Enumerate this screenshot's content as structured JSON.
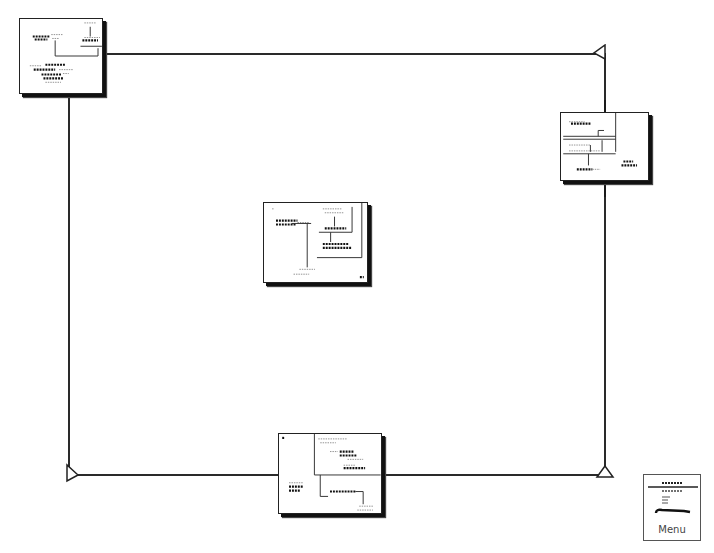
{
  "diagram": {
    "type": "overview-map",
    "frame": {
      "left": 69,
      "top": 54,
      "right": 605,
      "bottom": 475,
      "color": "#2a2a2a"
    },
    "corner_markers": [
      {
        "corner": "top-right",
        "shape": "triangle-pointing-left"
      },
      {
        "corner": "bottom-left",
        "shape": "triangle-pointing-right"
      },
      {
        "corner": "bottom-right",
        "shape": "triangle-pointing-up"
      }
    ],
    "thumbnails": [
      {
        "id": "page-top-left",
        "label": "",
        "position": "top-left"
      },
      {
        "id": "page-right",
        "label": "",
        "position": "right"
      },
      {
        "id": "page-center",
        "label": "",
        "position": "center"
      },
      {
        "id": "page-bottom",
        "label": "",
        "position": "bottom"
      }
    ]
  },
  "menu": {
    "label": "Menu"
  }
}
